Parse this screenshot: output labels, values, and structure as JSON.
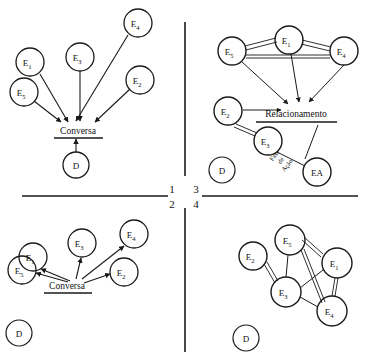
{
  "figure": {
    "ink_color": "#1a1a1a",
    "background": "#ffffff"
  },
  "dividers": {
    "vertical_x": 185,
    "horizontal_y": 196
  },
  "quadrant_numbers": {
    "top_left": "1",
    "bottom_left": "2",
    "top_right": "3",
    "bottom_right": "4"
  },
  "concepts": {
    "conversa_q1": "Conversa",
    "conversa_q2": "Conversa",
    "relacionamento": "Relacionamento",
    "fase_de_acao_line1": "Fase",
    "fase_de_acao_line2": "de",
    "fase_de_acao_line3": "Ação"
  },
  "quadrant1": {
    "label": "1",
    "nodes": [
      {
        "id": "e1",
        "base": "E",
        "sub": "1",
        "cx": 30,
        "cy": 62,
        "r": 14
      },
      {
        "id": "e3",
        "base": "E",
        "sub": "3",
        "cx": 80,
        "cy": 57,
        "r": 14
      },
      {
        "id": "e4",
        "base": "E",
        "sub": "4",
        "cx": 138,
        "cy": 23,
        "r": 14
      },
      {
        "id": "e5",
        "base": "E",
        "sub": "5",
        "cx": 24,
        "cy": 92,
        "r": 14
      },
      {
        "id": "e2",
        "base": "E",
        "sub": "2",
        "cx": 140,
        "cy": 80,
        "r": 14
      },
      {
        "id": "d",
        "base": "D",
        "sub": "",
        "cx": 76,
        "cy": 165,
        "r": 13
      }
    ],
    "concept_label": "Conversa",
    "concept_x": 78,
    "concept_y": 131,
    "arrows_into_concept": [
      "e1",
      "e3",
      "e4",
      "e5",
      "e2"
    ],
    "arrow_from_d": true
  },
  "quadrant3": {
    "label": "3",
    "nodes": [
      {
        "id": "e5",
        "base": "E",
        "sub": "5",
        "cx": 232,
        "cy": 51,
        "r": 14
      },
      {
        "id": "e1",
        "base": "E",
        "sub": "1",
        "cx": 289,
        "cy": 40,
        "r": 14
      },
      {
        "id": "e4",
        "base": "E",
        "sub": "4",
        "cx": 344,
        "cy": 51,
        "r": 14
      },
      {
        "id": "e2",
        "base": "E",
        "sub": "2",
        "cx": 228,
        "cy": 111,
        "r": 14
      },
      {
        "id": "e3",
        "base": "E",
        "sub": "3",
        "cx": 268,
        "cy": 141,
        "r": 14
      },
      {
        "id": "ea",
        "base": "EA",
        "sub": "",
        "cx": 317,
        "cy": 172,
        "r": 14
      },
      {
        "id": "d",
        "base": "D",
        "sub": "",
        "cx": 222,
        "cy": 170,
        "r": 13
      }
    ],
    "concept_label": "Relacionamento",
    "concept_x": 295,
    "concept_y": 114,
    "double_links": [
      [
        "e5",
        "e1"
      ],
      [
        "e1",
        "e4"
      ],
      [
        "e5",
        "e4"
      ],
      [
        "e2",
        "e3"
      ]
    ],
    "arrows_into_concept": [
      "e5",
      "e1",
      "e4",
      "e2"
    ],
    "phase_label": "Fase de Ação"
  },
  "quadrant2": {
    "label": "2",
    "nodes": [
      {
        "id": "e1",
        "base": "E",
        "sub": "1",
        "cx": 33,
        "cy": 257,
        "r": 14
      },
      {
        "id": "e3",
        "base": "E",
        "sub": "3",
        "cx": 82,
        "cy": 243,
        "r": 14
      },
      {
        "id": "e4",
        "base": "E",
        "sub": "4",
        "cx": 134,
        "cy": 234,
        "r": 14
      },
      {
        "id": "e5",
        "base": "E",
        "sub": "5",
        "cx": 22,
        "cy": 270,
        "r": 14
      },
      {
        "id": "e2",
        "base": "E",
        "sub": "2",
        "cx": 124,
        "cy": 272,
        "r": 14
      },
      {
        "id": "d",
        "base": "D",
        "sub": "",
        "cx": 19,
        "cy": 333,
        "r": 13
      }
    ],
    "concept_label": "Conversa",
    "concept_x": 67,
    "concept_y": 286,
    "arrows_from_concept": [
      "e1",
      "e3",
      "e4",
      "e5",
      "e2"
    ]
  },
  "quadrant4": {
    "label": "4",
    "nodes": [
      {
        "id": "e2",
        "base": "E",
        "sub": "2",
        "cx": 253,
        "cy": 256,
        "r": 14
      },
      {
        "id": "e5",
        "base": "E",
        "sub": "5",
        "cx": 290,
        "cy": 240,
        "r": 15
      },
      {
        "id": "e1",
        "base": "E",
        "sub": "1",
        "cx": 337,
        "cy": 263,
        "r": 15
      },
      {
        "id": "e3",
        "base": "E",
        "sub": "3",
        "cx": 286,
        "cy": 292,
        "r": 15
      },
      {
        "id": "e4",
        "base": "E",
        "sub": "4",
        "cx": 332,
        "cy": 311,
        "r": 15
      },
      {
        "id": "d",
        "base": "D",
        "sub": "",
        "cx": 246,
        "cy": 338,
        "r": 13
      }
    ],
    "double_links": [
      [
        "e2",
        "e3"
      ],
      [
        "e5",
        "e1"
      ],
      [
        "e5",
        "e4"
      ],
      [
        "e1",
        "e4"
      ]
    ],
    "single_links": [
      [
        "e5",
        "e3"
      ],
      [
        "e3",
        "e1"
      ],
      [
        "e3",
        "e4"
      ]
    ]
  }
}
